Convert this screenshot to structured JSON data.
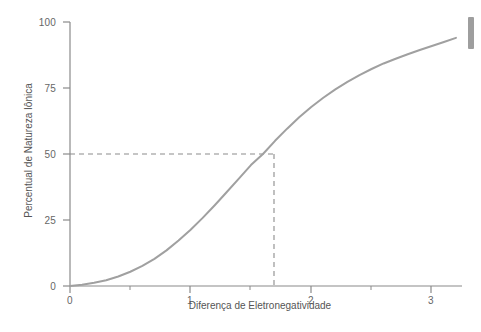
{
  "chart_data": {
    "type": "line",
    "title": "",
    "xlabel": "Diferença de Eletronegatividade",
    "ylabel": "Percentual de Natureza Iônica",
    "xlim": [
      0,
      3.25
    ],
    "ylim": [
      0,
      100
    ],
    "xticks": [
      0,
      1,
      2,
      3
    ],
    "xtick_labels": [
      "0",
      "1",
      "2",
      "3"
    ],
    "xminor_ticks": [
      0.5,
      1.5,
      2.5
    ],
    "yticks": [
      0,
      25,
      50,
      75,
      100
    ],
    "ytick_labels": [
      "0",
      "25",
      "50",
      "75",
      "100"
    ],
    "grid": false,
    "legend": null,
    "series": [
      {
        "name": "Percentual de Natureza Iônica",
        "color": "#a0a0a0",
        "line_width": 2,
        "x": [
          0.0,
          0.1,
          0.2,
          0.3,
          0.4,
          0.5,
          0.6,
          0.7,
          0.8,
          0.9,
          1.0,
          1.1,
          1.2,
          1.3,
          1.4,
          1.5,
          1.6,
          1.7,
          1.8,
          1.9,
          2.0,
          2.1,
          2.2,
          2.3,
          2.4,
          2.5,
          2.6,
          2.7,
          2.8,
          2.9,
          3.0,
          3.1,
          3.2
        ],
        "y": [
          0.0,
          0.5,
          1.2,
          2.2,
          3.6,
          5.4,
          7.6,
          10.3,
          13.5,
          17.2,
          21.3,
          25.8,
          30.6,
          35.6,
          40.7,
          45.8,
          50.0,
          55.0,
          59.6,
          63.9,
          67.8,
          71.3,
          74.5,
          77.3,
          79.9,
          82.2,
          84.3,
          86.1,
          87.8,
          89.4,
          90.9,
          92.4,
          94.0
        ]
      }
    ],
    "annotations": {
      "guide_lines": [
        {
          "type": "horizontal-dashed",
          "name": "fifty-percent-guide",
          "value": 50,
          "from_x": 0,
          "to_x": 1.7,
          "color": "#8c8c8c"
        },
        {
          "type": "vertical-dashed",
          "name": "electronegativity-guide",
          "value": 1.7,
          "from_y": 0,
          "to_y": 50,
          "color": "#8c8c8c"
        }
      ],
      "intersection_point": {
        "x": 1.7,
        "y": 50
      }
    },
    "axis_color": "#8a8a8a",
    "tick_label_color": "#666666",
    "background": "#ffffff"
  },
  "scrollbar": {
    "name": "vertical-scrollbar-thumb",
    "color": "#9e9e9e"
  }
}
